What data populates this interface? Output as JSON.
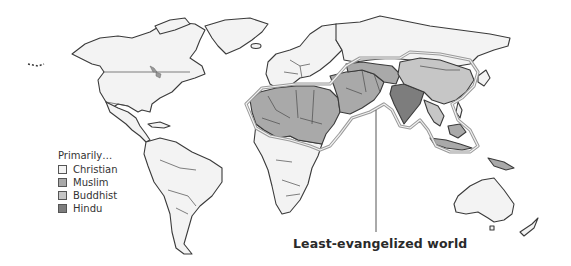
{
  "map": {
    "subject": "World map of primary religions and the least-evangelized world",
    "colors": {
      "christian": "#f3f3f3",
      "muslim": "#a9a9a9",
      "buddhist": "#c6c6c6",
      "hindu": "#7d7d7d",
      "window_outline": "#9a9a9a",
      "coast": "#3a3a3a"
    }
  },
  "legend": {
    "title": "Primarily…",
    "items": [
      {
        "label": "Christian",
        "color": "#f3f3f3"
      },
      {
        "label": "Muslim",
        "color": "#a9a9a9"
      },
      {
        "label": "Buddhist",
        "color": "#c6c6c6"
      },
      {
        "label": "Hindu",
        "color": "#7d7d7d"
      }
    ]
  },
  "annotation": {
    "label": "Least-evangelized world"
  }
}
